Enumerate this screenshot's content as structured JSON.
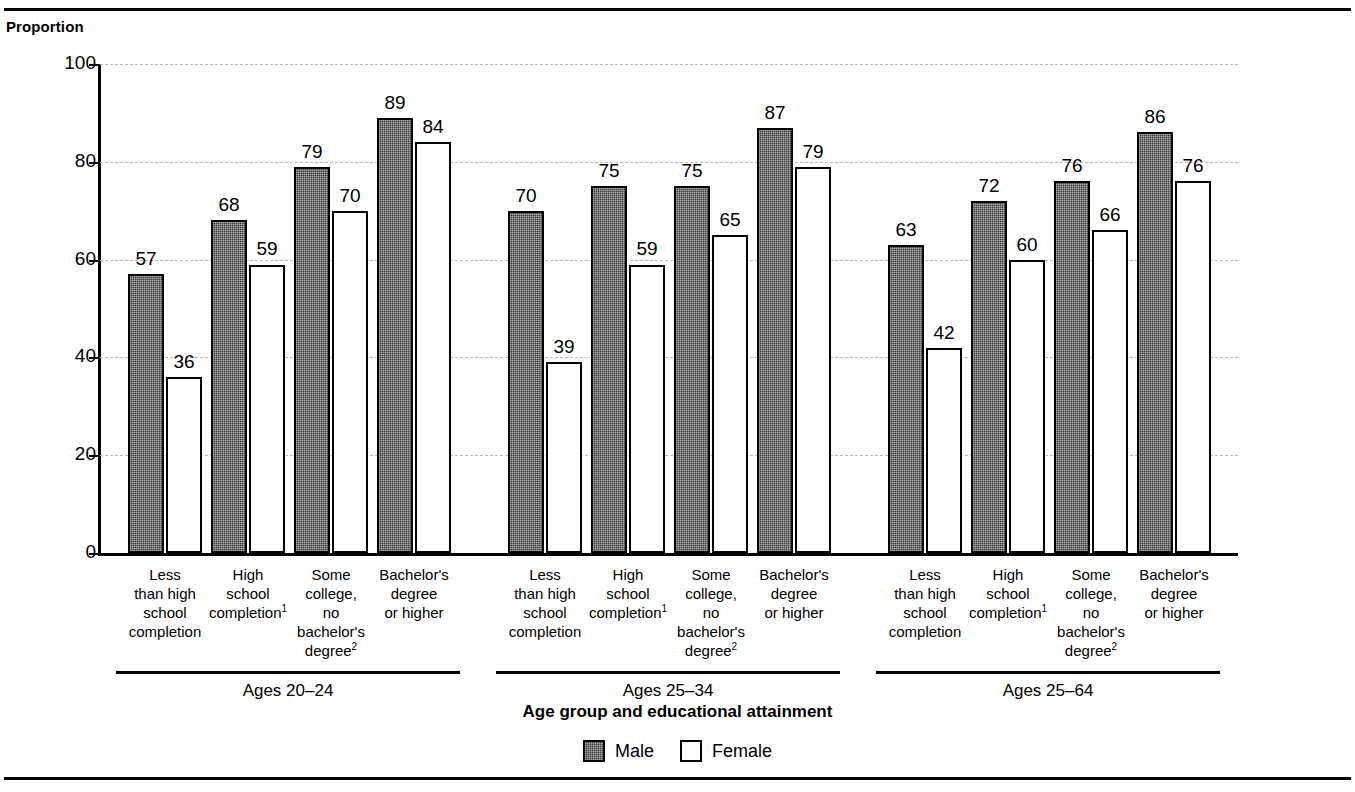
{
  "figure": {
    "title_partial": "",
    "y_axis_label": "Proportion",
    "x_axis_title": "Age group and educational attainment"
  },
  "legend": {
    "items": [
      {
        "label": "Male",
        "swatch": "male-swatch"
      },
      {
        "label": "Female",
        "swatch": "female-swatch"
      }
    ]
  },
  "chart_data": {
    "type": "bar",
    "title": "",
    "xlabel": "Age group and educational attainment",
    "ylabel": "Proportion",
    "ylim": [
      0,
      100
    ],
    "yticks": [
      0,
      20,
      40,
      60,
      80,
      100
    ],
    "ytick_labels": [
      "0",
      "20",
      "40",
      "60",
      "80",
      "100"
    ],
    "grid": true,
    "legend_position": "bottom-center",
    "group_label_key": "Age group",
    "groups": [
      {
        "label": "Ages 20–24",
        "categories": [
          "Less than high school completion",
          "High school completion¹",
          "Some college, no bachelor's degree²",
          "Bachelor's degree or higher"
        ],
        "series": [
          {
            "name": "Male",
            "values": [
              57,
              68,
              79,
              89
            ]
          },
          {
            "name": "Female",
            "values": [
              36,
              59,
              70,
              84
            ]
          }
        ]
      },
      {
        "label": "Ages 25–34",
        "categories": [
          "Less than high school completion",
          "High school completion¹",
          "Some college, no bachelor's degree²",
          "Bachelor's degree or higher"
        ],
        "series": [
          {
            "name": "Male",
            "values": [
              70,
              75,
              75,
              87
            ]
          },
          {
            "name": "Female",
            "values": [
              39,
              59,
              65,
              79
            ]
          }
        ]
      },
      {
        "label": "Ages 25–64",
        "categories": [
          "Less than high school completion",
          "High school completion¹",
          "Some college, no bachelor's degree²",
          "Bachelor's degree or higher"
        ],
        "series": [
          {
            "name": "Male",
            "values": [
              63,
              72,
              76,
              86
            ]
          },
          {
            "name": "Female",
            "values": [
              42,
              60,
              66,
              76
            ]
          }
        ]
      }
    ],
    "category_lines": [
      [
        "Less",
        "than high",
        "school",
        "completion"
      ],
      [
        "High",
        "school",
        "completion¹"
      ],
      [
        "Some",
        "college,",
        "no",
        "bachelor's",
        "degree²"
      ],
      [
        "Bachelor's",
        "degree",
        "or higher"
      ]
    ],
    "colors": {
      "male_fill": "#3f3f3f",
      "female_fill": "#ffffff",
      "outline": "#000000",
      "gridline": "#b9b9b9"
    }
  }
}
